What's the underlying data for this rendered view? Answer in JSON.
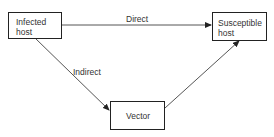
{
  "diagram": {
    "nodes": [
      {
        "id": "infected",
        "lines": [
          "Infected",
          "host"
        ]
      },
      {
        "id": "susceptible",
        "lines": [
          "Susceptible",
          "host"
        ]
      },
      {
        "id": "vector",
        "lines": [
          "Vector"
        ]
      }
    ],
    "edges": [
      {
        "from": "infected",
        "to": "susceptible",
        "label": "Direct"
      },
      {
        "from": "infected",
        "to": "vector",
        "label": "Indirect"
      },
      {
        "from": "vector",
        "to": "susceptible",
        "label": ""
      }
    ],
    "colors": {
      "line": "#222222",
      "text": "#333333",
      "background": "#ffffff"
    }
  }
}
